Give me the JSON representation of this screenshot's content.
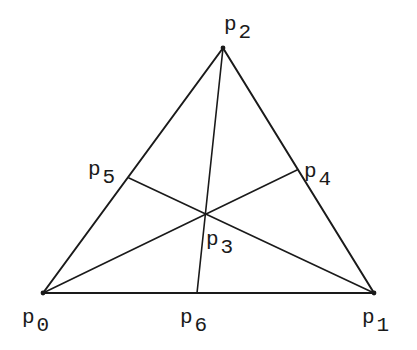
{
  "diagram": {
    "type": "triangle-with-cevians",
    "stroke_color": "#1a1a1a",
    "background": "#ffffff",
    "points": {
      "p0": {
        "x": 43,
        "y": 293,
        "label": "p",
        "subscript": "0",
        "label_x": 22,
        "label_y": 323,
        "sub_dx": 2,
        "sub_dy": 8
      },
      "p1": {
        "x": 374,
        "y": 293,
        "label": "p",
        "subscript": "1",
        "label_x": 362,
        "label_y": 323,
        "sub_dx": 2,
        "sub_dy": 8
      },
      "p2": {
        "x": 223,
        "y": 48,
        "label": "p",
        "subscript": "2",
        "label_x": 224,
        "label_y": 30,
        "sub_dx": 2,
        "sub_dy": 8
      },
      "p3": {
        "x": 205,
        "y": 213,
        "label": "p",
        "subscript": "3",
        "label_x": 206,
        "label_y": 245,
        "sub_dx": 2,
        "sub_dy": 8
      },
      "p4": {
        "x": 297,
        "y": 170,
        "label": "p",
        "subscript": "4",
        "label_x": 304,
        "label_y": 177,
        "sub_dx": 2,
        "sub_dy": 8
      },
      "p5": {
        "x": 129,
        "y": 178,
        "label": "p",
        "subscript": "5",
        "label_x": 88,
        "label_y": 175,
        "sub_dx": 2,
        "sub_dy": 8
      },
      "p6": {
        "x": 197,
        "y": 293,
        "label": "p",
        "subscript": "6",
        "label_x": 180,
        "label_y": 323,
        "sub_dx": 2,
        "sub_dy": 8
      }
    },
    "edges": [
      [
        "p0",
        "p1"
      ],
      [
        "p1",
        "p2"
      ],
      [
        "p2",
        "p0"
      ]
    ],
    "cevians": [
      [
        "p2",
        "p6"
      ],
      [
        "p0",
        "p4"
      ],
      [
        "p1",
        "p5"
      ]
    ],
    "vertex_dots": [
      "p0",
      "p1",
      "p2"
    ]
  }
}
